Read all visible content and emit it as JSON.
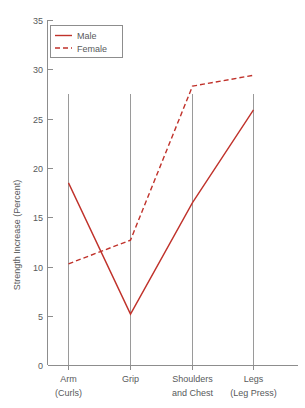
{
  "chart_data": {
    "type": "line",
    "title": "",
    "xlabel": "",
    "ylabel": "Strength Increase (Percent)",
    "categories": [
      "Arm\n(Curls)",
      "Grip",
      "Shoulders\nand Chest",
      "Legs\n(Leg Press)"
    ],
    "category_lines": [
      {
        "line1": "Arm",
        "line2": "(Curls)"
      },
      {
        "line1": "Grip",
        "line2": ""
      },
      {
        "line1": "Shoulders",
        "line2": "and Chest"
      },
      {
        "line1": "Legs",
        "line2": "(Leg Press)"
      }
    ],
    "series": [
      {
        "name": "Male",
        "style": "solid",
        "color": "#C0322B",
        "values": [
          18.5,
          5.2,
          16.5,
          25.9
        ]
      },
      {
        "name": "Female",
        "style": "dashed",
        "color": "#C0322B",
        "values": [
          10.3,
          12.7,
          28.3,
          29.4
        ]
      }
    ],
    "ylim": [
      0,
      35
    ],
    "ytick_step": 5,
    "ytick_labels": [
      "0",
      "5",
      "10",
      "15",
      "20",
      "25",
      "30",
      "35"
    ],
    "grid": "category-verticals-only",
    "legend": {
      "position": "top-left",
      "entries": [
        {
          "label": "Male",
          "style": "solid"
        },
        {
          "label": "Female",
          "style": "dashed"
        }
      ]
    }
  },
  "colors": {
    "series": "#C0322B",
    "axis": "#8d8d8d",
    "text": "#58595b",
    "background": "#ffffff"
  }
}
